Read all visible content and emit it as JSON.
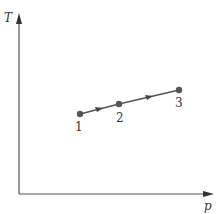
{
  "diagram": {
    "type": "state-path",
    "axes": {
      "y_label": "T",
      "x_label": "p"
    },
    "points": [
      {
        "label": "1",
        "x": 80,
        "y": 114
      },
      {
        "label": "2",
        "x": 119,
        "y": 104
      },
      {
        "label": "3",
        "x": 179,
        "y": 90
      }
    ],
    "colors": {
      "line": "#555555",
      "point": "#555555",
      "axis": "#555555",
      "text": "#333333"
    }
  }
}
